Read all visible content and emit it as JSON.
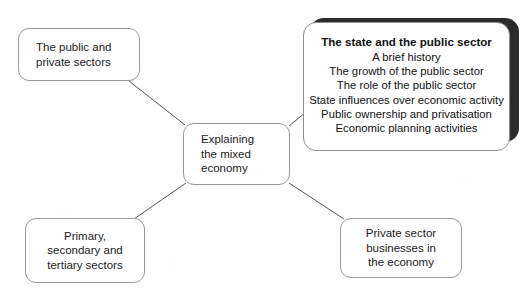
{
  "diagram": {
    "type": "mind-map",
    "background_color": "#fefefe",
    "line_color": "#555555",
    "box_border_color": "#9a9a9a",
    "emphasis_shadow_color": "#2b2b2b",
    "text_color": "#1b1b1b"
  },
  "center_node": {
    "name": "explaining-the-mixed-economy",
    "lines": [
      "Explaining",
      "the mixed",
      "economy"
    ],
    "align": "left"
  },
  "nodes": [
    {
      "name": "the-public-and-private-sectors",
      "position": "top-left",
      "lines": [
        "The public and",
        "private sectors"
      ],
      "align": "left",
      "emphasised": false
    },
    {
      "name": "primary-secondary-tertiary-sectors",
      "position": "bottom-left",
      "lines": [
        "Primary,",
        "secondary and",
        "tertiary sectors"
      ],
      "align": "center",
      "emphasised": false
    },
    {
      "name": "private-sector-businesses-in-the-economy",
      "position": "bottom-right",
      "lines": [
        "Private sector",
        "businesses in",
        "the economy"
      ],
      "align": "center",
      "emphasised": false
    }
  ],
  "emphasised_node": {
    "name": "the-state-and-the-public-sector",
    "position": "top-right",
    "heading": "The state and the public sector",
    "items": [
      "A brief history",
      "The growth of the public sector",
      "The role of the public sector",
      "State influences over economic activity",
      "Public ownership and privatisation",
      "Economic planning activities"
    ],
    "align": "center",
    "emphasised": true
  },
  "connectors": [
    {
      "name": "connector-centre-to-public-private",
      "from": "center",
      "to": "the-public-and-private-sectors"
    },
    {
      "name": "connector-centre-to-state-sector",
      "from": "center",
      "to": "the-state-and-the-public-sector"
    },
    {
      "name": "connector-centre-to-primary-sectors",
      "from": "center",
      "to": "primary-secondary-tertiary-sectors"
    },
    {
      "name": "connector-centre-to-private-business",
      "from": "center",
      "to": "private-sector-businesses-in-the-economy"
    }
  ]
}
